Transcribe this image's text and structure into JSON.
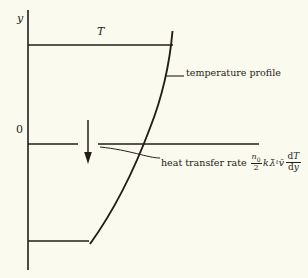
{
  "figure": {
    "background_color": "#fbfaef",
    "ink_color": "#231f18",
    "axes": {
      "y_axis_label": "y",
      "origin_label": "0"
    },
    "labels": {
      "temperature_symbol": "T",
      "temperature_profile": "temperature profile",
      "heat_transfer_rate": "heat transfer rate"
    },
    "formula": {
      "fraction_numerator": "n",
      "fraction_numerator_subscript": "0",
      "fraction_denominator": "2",
      "factor_k": "k",
      "factor_lambda": "λ̄",
      "factor_lambda_subscript": "t",
      "factor_v": "v̄",
      "derivative_numerator_d": "d",
      "derivative_numerator_var": "T",
      "derivative_denominator_d": "d",
      "derivative_denominator_var": "y"
    },
    "geometry": {
      "y_axis_x": 28,
      "y_axis_top": 10,
      "y_axis_bottom": 270,
      "top_line_y": 45,
      "top_line_x1": 28,
      "top_line_x2": 172,
      "x_axis_y": 144,
      "x_axis_left_x1": 28,
      "x_axis_left_x2": 78,
      "x_axis_right_x1": 98,
      "x_axis_right_x2": 258,
      "bottom_line_y": 241,
      "bottom_line_x1": 28,
      "bottom_line_x2": 88,
      "arrow_x": 88,
      "arrow_y_top": 120,
      "arrow_y_bottom": 163,
      "curve_description": "temperature profile curve, concave-right, from (172,32) at top to (90,244) at bottom"
    }
  }
}
